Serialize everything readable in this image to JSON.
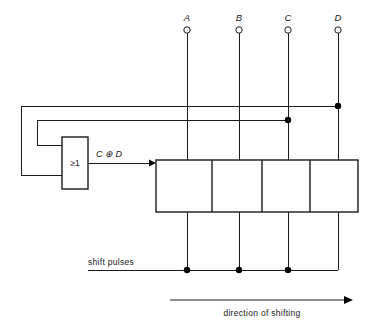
{
  "diagram": {
    "terminals": [
      {
        "label": "A",
        "x": 187
      },
      {
        "label": "B",
        "x": 239
      },
      {
        "label": "C",
        "x": 288
      },
      {
        "label": "D",
        "x": 338
      }
    ],
    "gate": {
      "symbol": "≥1",
      "name": "exclusive-or-gate",
      "output_label": "C ⊕ D"
    },
    "labels": {
      "shift_pulses": "shift pulses",
      "direction": "direction of shifting"
    },
    "register": {
      "cell_count": 4,
      "cells": [
        "A",
        "B",
        "C",
        "D"
      ]
    },
    "colors": {
      "line": "#1a1a1a",
      "junction": "#000000",
      "background": "#ffffff"
    }
  }
}
